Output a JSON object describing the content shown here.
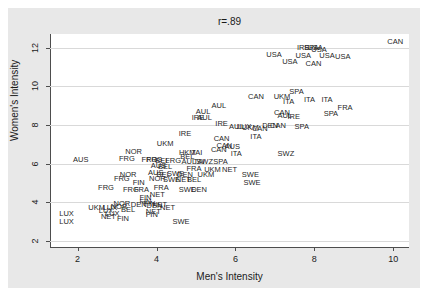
{
  "chart_data": {
    "type": "scatter",
    "title": "r=.89",
    "xlabel": "Men's Intensity",
    "ylabel": "Women's Intensity",
    "xlim": [
      1.3,
      10.4
    ],
    "ylim": [
      1.7,
      12.7
    ],
    "xticks": [
      "2",
      "4",
      "6",
      "8",
      "10"
    ],
    "xtick_values": [
      2,
      4,
      6,
      8,
      10
    ],
    "yticks": [
      "2",
      "4",
      "6",
      "8",
      "10",
      "12"
    ],
    "ytick_values": [
      2,
      4,
      6,
      8,
      10,
      12
    ],
    "grid": "horizontal",
    "legend": "none",
    "marker_style": "text-labels",
    "points": [
      {
        "label": "CAN",
        "x": 10.05,
        "y": 12.35
      },
      {
        "label": "IRE",
        "x": 7.72,
        "y": 12.02
      },
      {
        "label": "SPA",
        "x": 7.92,
        "y": 12.05
      },
      {
        "label": "USA",
        "x": 8.02,
        "y": 12.02
      },
      {
        "label": "USA",
        "x": 8.12,
        "y": 11.95
      },
      {
        "label": "USA",
        "x": 6.98,
        "y": 11.65
      },
      {
        "label": "USA",
        "x": 7.72,
        "y": 11.62
      },
      {
        "label": "USA",
        "x": 8.32,
        "y": 11.62
      },
      {
        "label": "USA",
        "x": 8.72,
        "y": 11.58
      },
      {
        "label": "USA",
        "x": 7.38,
        "y": 11.28
      },
      {
        "label": "CAN",
        "x": 7.98,
        "y": 11.18
      },
      {
        "label": "SPA",
        "x": 7.55,
        "y": 9.78
      },
      {
        "label": "CAN",
        "x": 6.52,
        "y": 9.52
      },
      {
        "label": "UKM",
        "x": 7.18,
        "y": 9.52
      },
      {
        "label": "ITA",
        "x": 7.35,
        "y": 9.25
      },
      {
        "label": "ITA",
        "x": 7.88,
        "y": 9.32
      },
      {
        "label": "ITA",
        "x": 8.32,
        "y": 9.35
      },
      {
        "label": "AUL",
        "x": 5.58,
        "y": 9.05
      },
      {
        "label": "FRA",
        "x": 8.78,
        "y": 8.95
      },
      {
        "label": "AUL",
        "x": 5.18,
        "y": 8.72
      },
      {
        "label": "CAN",
        "x": 7.18,
        "y": 8.68
      },
      {
        "label": "SPA",
        "x": 8.42,
        "y": 8.62
      },
      {
        "label": "IRE",
        "x": 5.05,
        "y": 8.42
      },
      {
        "label": "AUL",
        "x": 5.22,
        "y": 8.42
      },
      {
        "label": "AUL",
        "x": 7.25,
        "y": 8.52
      },
      {
        "label": "IRE",
        "x": 7.48,
        "y": 8.48
      },
      {
        "label": "IRE",
        "x": 5.65,
        "y": 8.08
      },
      {
        "label": "AUL",
        "x": 6.02,
        "y": 7.95
      },
      {
        "label": "LUX",
        "x": 6.22,
        "y": 7.95
      },
      {
        "label": "DEN",
        "x": 6.88,
        "y": 8.02
      },
      {
        "label": "CAN",
        "x": 7.08,
        "y": 8.02
      },
      {
        "label": "SPA",
        "x": 7.68,
        "y": 7.95
      },
      {
        "label": "UKM",
        "x": 6.38,
        "y": 7.88
      },
      {
        "label": "CAN",
        "x": 6.62,
        "y": 7.82
      },
      {
        "label": "IRE",
        "x": 4.72,
        "y": 7.58
      },
      {
        "label": "ITA",
        "x": 6.52,
        "y": 7.42
      },
      {
        "label": "CAN",
        "x": 5.65,
        "y": 7.32
      },
      {
        "label": "UKM",
        "x": 4.22,
        "y": 7.05
      },
      {
        "label": "CAN",
        "x": 5.72,
        "y": 6.95
      },
      {
        "label": "AUS",
        "x": 5.92,
        "y": 6.92
      },
      {
        "label": "CAN",
        "x": 5.58,
        "y": 6.75
      },
      {
        "label": "HKM",
        "x": 4.78,
        "y": 6.62
      },
      {
        "label": "TAI",
        "x": 5.02,
        "y": 6.62
      },
      {
        "label": "NOR",
        "x": 3.42,
        "y": 6.68
      },
      {
        "label": "ITA",
        "x": 6.02,
        "y": 6.58
      },
      {
        "label": "SWZ",
        "x": 7.28,
        "y": 6.58
      },
      {
        "label": "BEL",
        "x": 4.78,
        "y": 6.38
      },
      {
        "label": "FRG",
        "x": 3.25,
        "y": 6.32
      },
      {
        "label": "AUS",
        "x": 2.08,
        "y": 6.25
      },
      {
        "label": "FRG",
        "x": 3.82,
        "y": 6.25
      },
      {
        "label": "FRG",
        "x": 3.95,
        "y": 6.25
      },
      {
        "label": "BEL",
        "x": 4.15,
        "y": 6.18
      },
      {
        "label": "FRG",
        "x": 4.42,
        "y": 6.18
      },
      {
        "label": "AUL",
        "x": 4.82,
        "y": 6.15
      },
      {
        "label": "TAI",
        "x": 5.08,
        "y": 6.15
      },
      {
        "label": "SWZ",
        "x": 5.22,
        "y": 6.12
      },
      {
        "label": "SPA",
        "x": 5.62,
        "y": 6.12
      },
      {
        "label": "AUS",
        "x": 4.05,
        "y": 5.92
      },
      {
        "label": "BEL",
        "x": 4.22,
        "y": 5.88
      },
      {
        "label": "FRA",
        "x": 4.95,
        "y": 5.78
      },
      {
        "label": "UKM",
        "x": 5.42,
        "y": 5.72
      },
      {
        "label": "NET",
        "x": 5.85,
        "y": 5.72
      },
      {
        "label": "AUS",
        "x": 3.98,
        "y": 5.55
      },
      {
        "label": "BEL",
        "x": 4.18,
        "y": 5.48
      },
      {
        "label": "SWE",
        "x": 4.48,
        "y": 5.52
      },
      {
        "label": "DEN",
        "x": 4.72,
        "y": 5.48
      },
      {
        "label": "UKM",
        "x": 5.25,
        "y": 5.48
      },
      {
        "label": "SWE",
        "x": 6.38,
        "y": 5.48
      },
      {
        "label": "NOR",
        "x": 3.28,
        "y": 5.45
      },
      {
        "label": "FRG",
        "x": 3.12,
        "y": 5.28
      },
      {
        "label": "NOR",
        "x": 4.02,
        "y": 5.25
      },
      {
        "label": "SWE",
        "x": 4.38,
        "y": 5.22
      },
      {
        "label": "NET",
        "x": 4.68,
        "y": 5.22
      },
      {
        "label": "BEL",
        "x": 4.95,
        "y": 5.22
      },
      {
        "label": "FIN",
        "x": 3.55,
        "y": 5.08
      },
      {
        "label": "SWE",
        "x": 6.42,
        "y": 5.05
      },
      {
        "label": "FRG",
        "x": 2.72,
        "y": 4.78
      },
      {
        "label": "FRG",
        "x": 3.35,
        "y": 4.72
      },
      {
        "label": "FRA",
        "x": 3.62,
        "y": 4.72
      },
      {
        "label": "FRA",
        "x": 4.12,
        "y": 4.78
      },
      {
        "label": "SWE",
        "x": 4.78,
        "y": 4.72
      },
      {
        "label": "DEN",
        "x": 5.08,
        "y": 4.72
      },
      {
        "label": "NET",
        "x": 4.02,
        "y": 4.45
      },
      {
        "label": "FIN",
        "x": 3.72,
        "y": 4.28
      },
      {
        "label": "NOR",
        "x": 3.12,
        "y": 3.95
      },
      {
        "label": "DEN",
        "x": 3.55,
        "y": 3.92
      },
      {
        "label": "FIN",
        "x": 3.82,
        "y": 3.95
      },
      {
        "label": "NET",
        "x": 4.08,
        "y": 3.92
      },
      {
        "label": "UKM",
        "x": 2.48,
        "y": 3.78
      },
      {
        "label": "LUX",
        "x": 2.82,
        "y": 3.78
      },
      {
        "label": "NOR",
        "x": 3.05,
        "y": 3.82
      },
      {
        "label": "LUX",
        "x": 2.72,
        "y": 3.62
      },
      {
        "label": "BEL",
        "x": 3.28,
        "y": 3.65
      },
      {
        "label": "NET",
        "x": 3.92,
        "y": 3.55
      },
      {
        "label": "LUX",
        "x": 1.72,
        "y": 3.45
      },
      {
        "label": "LUX",
        "x": 2.88,
        "y": 3.48
      },
      {
        "label": "NET",
        "x": 2.78,
        "y": 3.28
      },
      {
        "label": "FIN",
        "x": 3.15,
        "y": 3.22
      },
      {
        "label": "LUX",
        "x": 1.72,
        "y": 3.05
      },
      {
        "label": "SWE",
        "x": 4.62,
        "y": 3.05
      },
      {
        "label": "FIN",
        "x": 3.72,
        "y": 4.08
      },
      {
        "label": "NET",
        "x": 4.28,
        "y": 3.78
      },
      {
        "label": "DEN",
        "x": 3.95,
        "y": 3.88
      },
      {
        "label": "FIN",
        "x": 3.88,
        "y": 3.42
      }
    ]
  },
  "colors": {
    "figure_background": "#e8e8e8",
    "plot_background": "#ffffff",
    "gridline": "#d9d9d9",
    "axis": "#4d4d4d",
    "text": "#1a1a1a",
    "marker_text": "#262626"
  }
}
